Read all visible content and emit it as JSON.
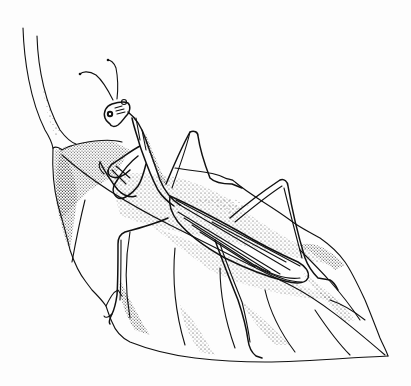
{
  "image": {
    "subject": "Pen-and-ink illustration of a praying mantis on a leaf",
    "style": "black and white stippled line drawing",
    "colors": {
      "ink": "#111111",
      "paper": "#fdfdfd"
    }
  }
}
